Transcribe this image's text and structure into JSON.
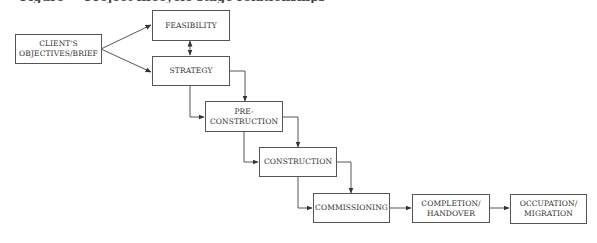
{
  "title": "Figure — Project lifecycle stage relationships",
  "diagram": {
    "nodes": [
      {
        "id": "client",
        "lines": [
          "CLIENT'S",
          "OBJECTIVES/BRIEF"
        ]
      },
      {
        "id": "feasibility",
        "lines": [
          "FEASIBILITY"
        ]
      },
      {
        "id": "strategy",
        "lines": [
          "STRATEGY"
        ]
      },
      {
        "id": "preconstruction",
        "lines": [
          "PRE-",
          "CONSTRUCTION"
        ]
      },
      {
        "id": "construction",
        "lines": [
          "CONSTRUCTION"
        ]
      },
      {
        "id": "commissioning",
        "lines": [
          "COMMISSIONING"
        ]
      },
      {
        "id": "completion",
        "lines": [
          "COMPLETION/",
          "HANDOVER"
        ]
      },
      {
        "id": "occupation",
        "lines": [
          "OCCUPATION/",
          "MIGRATION"
        ]
      }
    ],
    "edges": [
      {
        "from": "client",
        "to": "feasibility"
      },
      {
        "from": "client",
        "to": "strategy"
      },
      {
        "from": "feasibility",
        "to": "strategy",
        "bidirectional": true
      },
      {
        "from": "strategy",
        "to": "preconstruction"
      },
      {
        "from": "strategy",
        "to": "preconstruction"
      },
      {
        "from": "preconstruction",
        "to": "construction"
      },
      {
        "from": "preconstruction",
        "to": "construction"
      },
      {
        "from": "construction",
        "to": "commissioning"
      },
      {
        "from": "construction",
        "to": "commissioning"
      },
      {
        "from": "commissioning",
        "to": "completion"
      },
      {
        "from": "completion",
        "to": "occupation"
      }
    ],
    "line_color": "#444444"
  }
}
